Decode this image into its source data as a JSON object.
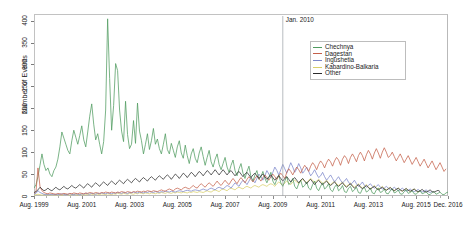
{
  "chart_data": {
    "type": "line",
    "title": "",
    "xlabel": "",
    "ylabel": "Number of Events",
    "ylim": [
      0,
      415
    ],
    "yticks": [
      0,
      50,
      100,
      150,
      200,
      250,
      300,
      350,
      400
    ],
    "ytick_labels": [
      "0",
      "50",
      "100",
      "150",
      "200",
      "250",
      "300",
      "350",
      "400"
    ],
    "xtick_labels": [
      "Aug. 1999",
      "Aug. 2001",
      "Aug. 2003",
      "Aug. 2005",
      "Aug. 2007",
      "Aug. 2009",
      "Aug. 2011",
      "Aug. 2013",
      "Aug. 2015",
      "Dec. 2016"
    ],
    "xtick_index": [
      0,
      24,
      48,
      72,
      96,
      120,
      144,
      168,
      192,
      208
    ],
    "x_start": "Aug. 1999",
    "x_end": "Dec. 2016",
    "n_points": 209,
    "grid": false,
    "legend_position": "top-right",
    "annotations": [
      {
        "label": "Jan. 2010",
        "x_index": 125,
        "type": "vertical-line"
      }
    ],
    "colors": {
      "Chechnya": "#4f9b5f",
      "Dagestan": "#c4604a",
      "Ingushetia": "#7b86c9",
      "Kabardino-Balkaria": "#d8cf6a",
      "Other": "#2b2b2b"
    },
    "series": [
      {
        "name": "Chechnya",
        "color": "#4f9b5f",
        "values": [
          18,
          26,
          44,
          70,
          96,
          72,
          58,
          64,
          50,
          44,
          58,
          66,
          84,
          112,
          146,
          132,
          118,
          104,
          96,
          126,
          150,
          134,
          118,
          138,
          160,
          128,
          112,
          146,
          182,
          210,
          164,
          128,
          142,
          118,
          96,
          124,
          196,
          404,
          268,
          150,
          206,
          302,
          286,
          196,
          148,
          124,
          216,
          140,
          108,
          118,
          172,
          120,
          212,
          148,
          126,
          96,
          118,
          142,
          106,
          126,
          154,
          118,
          130,
          108,
          96,
          118,
          142,
          106,
          96,
          120,
          104,
          88,
          112,
          126,
          98,
          86,
          116,
          92,
          74,
          96,
          108,
          86,
          76,
          98,
          112,
          90,
          70,
          88,
          104,
          78,
          66,
          84,
          96,
          72,
          60,
          74,
          88,
          66,
          54,
          70,
          82,
          58,
          46,
          62,
          74,
          52,
          40,
          56,
          68,
          44,
          34,
          48,
          58,
          38,
          44,
          56,
          40,
          30,
          42,
          54,
          34,
          26,
          38,
          48,
          30,
          22,
          34,
          44,
          26,
          30,
          40,
          22,
          16,
          28,
          36,
          20,
          24,
          32,
          18,
          14,
          26,
          34,
          18,
          12,
          22,
          30,
          16,
          20,
          28,
          14,
          10,
          20,
          26,
          12,
          16,
          24,
          10,
          8,
          18,
          22,
          10,
          14,
          20,
          8,
          6,
          16,
          20,
          9,
          12,
          18,
          7,
          5,
          14,
          18,
          8,
          10,
          16,
          6,
          5,
          12,
          16,
          7,
          9,
          14,
          5,
          4,
          10,
          14,
          6,
          8,
          12,
          5,
          4,
          9,
          12,
          5,
          7,
          10,
          4,
          3,
          8,
          10,
          4,
          6,
          9,
          4,
          3,
          7,
          9,
          4,
          5,
          8,
          3
        ]
      },
      {
        "name": "Dagestan",
        "color": "#c4604a",
        "values": [
          6,
          10,
          64,
          22,
          12,
          8,
          6,
          5,
          7,
          6,
          5,
          4,
          6,
          5,
          4,
          6,
          5,
          4,
          6,
          5,
          7,
          6,
          5,
          7,
          6,
          5,
          7,
          6,
          8,
          7,
          6,
          8,
          7,
          6,
          8,
          7,
          9,
          8,
          7,
          9,
          8,
          7,
          9,
          8,
          10,
          9,
          8,
          10,
          9,
          8,
          10,
          9,
          11,
          10,
          9,
          11,
          10,
          12,
          11,
          10,
          12,
          11,
          10,
          12,
          14,
          12,
          11,
          14,
          16,
          14,
          12,
          16,
          18,
          16,
          14,
          18,
          20,
          18,
          16,
          20,
          24,
          20,
          18,
          24,
          28,
          24,
          20,
          26,
          30,
          26,
          22,
          28,
          34,
          28,
          24,
          30,
          36,
          30,
          26,
          34,
          40,
          34,
          28,
          36,
          42,
          36,
          30,
          38,
          44,
          38,
          32,
          40,
          46,
          40,
          34,
          42,
          48,
          42,
          36,
          44,
          50,
          44,
          38,
          46,
          52,
          46,
          40,
          54,
          62,
          56,
          48,
          58,
          66,
          60,
          52,
          62,
          70,
          64,
          56,
          68,
          76,
          70,
          60,
          72,
          80,
          74,
          64,
          76,
          84,
          78,
          68,
          80,
          88,
          82,
          70,
          84,
          92,
          86,
          74,
          88,
          96,
          88,
          78,
          92,
          100,
          92,
          80,
          94,
          104,
          96,
          84,
          98,
          108,
          98,
          86,
          100,
          110,
          100,
          88,
          92,
          100,
          90,
          80,
          88,
          96,
          86,
          76,
          84,
          92,
          82,
          72,
          80,
          88,
          78,
          68,
          76,
          84,
          74,
          64,
          72,
          80,
          70,
          60,
          68,
          76,
          66,
          56,
          62
        ]
      },
      {
        "name": "Ingushetia",
        "color": "#7b86c9",
        "values": [
          4,
          6,
          12,
          8,
          6,
          4,
          3,
          4,
          3,
          4,
          3,
          4,
          3,
          4,
          5,
          4,
          3,
          4,
          5,
          4,
          3,
          5,
          4,
          3,
          5,
          4,
          6,
          5,
          4,
          6,
          5,
          4,
          6,
          5,
          7,
          6,
          5,
          7,
          6,
          5,
          7,
          6,
          8,
          7,
          6,
          8,
          7,
          6,
          8,
          7,
          9,
          8,
          7,
          9,
          8,
          7,
          9,
          8,
          10,
          9,
          8,
          10,
          9,
          8,
          10,
          9,
          11,
          10,
          9,
          11,
          10,
          9,
          11,
          12,
          11,
          10,
          12,
          13,
          12,
          11,
          13,
          14,
          13,
          12,
          14,
          16,
          14,
          13,
          16,
          18,
          16,
          14,
          18,
          20,
          18,
          16,
          20,
          24,
          22,
          18,
          24,
          30,
          26,
          22,
          30,
          36,
          32,
          26,
          34,
          42,
          36,
          30,
          40,
          50,
          44,
          36,
          46,
          58,
          50,
          42,
          54,
          66,
          58,
          48,
          60,
          72,
          62,
          52,
          64,
          76,
          66,
          54,
          62,
          74,
          64,
          52,
          58,
          66,
          56,
          46,
          52,
          60,
          50,
          42,
          46,
          54,
          44,
          36,
          42,
          48,
          40,
          32,
          38,
          44,
          36,
          30,
          34,
          40,
          32,
          26,
          30,
          36,
          28,
          22,
          26,
          32,
          24,
          20,
          24,
          28,
          22,
          18,
          22,
          26,
          20,
          16,
          18,
          22,
          18,
          14,
          16,
          20,
          16,
          12,
          14,
          18,
          14,
          11,
          13,
          16,
          12,
          10,
          12,
          15,
          11,
          9,
          11,
          14,
          10,
          8,
          10
        ]
      },
      {
        "name": "Kabardino-Balkaria",
        "color": "#d8cf6a",
        "values": [
          2,
          3,
          4,
          3,
          2,
          3,
          2,
          3,
          2,
          3,
          2,
          3,
          2,
          3,
          2,
          3,
          4,
          3,
          2,
          3,
          4,
          3,
          2,
          4,
          3,
          2,
          4,
          3,
          5,
          4,
          3,
          5,
          4,
          3,
          5,
          4,
          3,
          5,
          4,
          3,
          5,
          4,
          6,
          5,
          4,
          6,
          5,
          4,
          6,
          5,
          4,
          6,
          5,
          7,
          6,
          5,
          7,
          6,
          5,
          7,
          6,
          5,
          7,
          6,
          8,
          7,
          6,
          8,
          7,
          6,
          8,
          7,
          9,
          8,
          7,
          9,
          8,
          7,
          9,
          8,
          10,
          9,
          8,
          10,
          9,
          8,
          10,
          12,
          10,
          9,
          12,
          14,
          12,
          10,
          14,
          16,
          14,
          12,
          16,
          18,
          16,
          14,
          18,
          20,
          18,
          16,
          20,
          22,
          20,
          18,
          22,
          24,
          22,
          20,
          24,
          26,
          24,
          22,
          26,
          28,
          26,
          22,
          28,
          32,
          28,
          24,
          30,
          34,
          30,
          26,
          32,
          36,
          32,
          28,
          34,
          38,
          34,
          30,
          36,
          40,
          36,
          30,
          34,
          38,
          34,
          28,
          32,
          36,
          30,
          26,
          30,
          34,
          28,
          24,
          28,
          32,
          26,
          22,
          26,
          30,
          24,
          20,
          24,
          28,
          22,
          18,
          22,
          26,
          20,
          16,
          20,
          24,
          18,
          15,
          18,
          22,
          17,
          14,
          17,
          20,
          15,
          12,
          15,
          18,
          14,
          11,
          14,
          17,
          13,
          10,
          13,
          16,
          12,
          9,
          12
        ]
      },
      {
        "name": "Other",
        "color": "#2b2b2b",
        "values": [
          8,
          10,
          14,
          20,
          16,
          12,
          14,
          18,
          14,
          12,
          16,
          20,
          16,
          14,
          18,
          22,
          18,
          16,
          20,
          24,
          20,
          18,
          22,
          26,
          22,
          18,
          24,
          28,
          24,
          20,
          26,
          30,
          26,
          22,
          28,
          32,
          28,
          24,
          30,
          34,
          30,
          26,
          32,
          36,
          32,
          28,
          34,
          38,
          34,
          30,
          36,
          40,
          36,
          32,
          38,
          42,
          38,
          34,
          40,
          44,
          40,
          36,
          42,
          46,
          42,
          38,
          44,
          48,
          44,
          38,
          44,
          50,
          46,
          40,
          46,
          52,
          48,
          42,
          48,
          54,
          50,
          44,
          50,
          56,
          52,
          46,
          52,
          58,
          54,
          48,
          54,
          60,
          54,
          48,
          54,
          60,
          54,
          48,
          54,
          58,
          52,
          46,
          52,
          56,
          50,
          44,
          50,
          54,
          48,
          42,
          48,
          52,
          46,
          40,
          46,
          50,
          44,
          38,
          44,
          48,
          42,
          36,
          42,
          46,
          40,
          34,
          40,
          44,
          38,
          32,
          38,
          42,
          36,
          30,
          36,
          40,
          34,
          28,
          34,
          38,
          32,
          26,
          32,
          36,
          30,
          26,
          30,
          34,
          28,
          24,
          28,
          32,
          26,
          22,
          26,
          30,
          24,
          20,
          24,
          28,
          22,
          18,
          22,
          26,
          20,
          17,
          20,
          24,
          19,
          16,
          19,
          22,
          17,
          14,
          17,
          20,
          16,
          13,
          16,
          19,
          15,
          12,
          15,
          18,
          14,
          11,
          14,
          17,
          13,
          11,
          13,
          16,
          12,
          10,
          12,
          15,
          11,
          9,
          11,
          14,
          10,
          9,
          11,
          13,
          10
        ]
      }
    ]
  },
  "legend": {
    "entries": [
      {
        "label": "Chechnya"
      },
      {
        "label": "Dagestan"
      },
      {
        "label": "Ingushetia"
      },
      {
        "label": "Kabardino-Balkaria"
      },
      {
        "label": "Other"
      }
    ]
  }
}
